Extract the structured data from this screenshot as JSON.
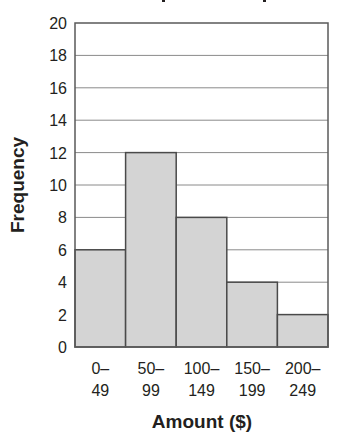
{
  "chart_data": {
    "type": "bar",
    "subtype": "histogram",
    "title": "",
    "title_note": "title cut off at top edge of image",
    "xlabel": "Amount ($)",
    "ylabel": "Frequency",
    "categories": [
      "0–49",
      "50–99",
      "100–149",
      "150–199",
      "200–249"
    ],
    "category_lines": [
      [
        "0–",
        "49"
      ],
      [
        "50–",
        "99"
      ],
      [
        "100–",
        "149"
      ],
      [
        "150–",
        "199"
      ],
      [
        "200–",
        "249"
      ]
    ],
    "values": [
      6,
      12,
      8,
      4,
      2
    ],
    "ylim": [
      0,
      20
    ],
    "yticks": [
      0,
      2,
      4,
      6,
      8,
      10,
      12,
      14,
      16,
      18,
      20
    ],
    "grid": true,
    "legend": null,
    "colors": {
      "bar_fill": "#d4d4d4",
      "bar_stroke": "#4a4a4a",
      "grid": "#8a8a8a",
      "text": "#231f20"
    }
  }
}
